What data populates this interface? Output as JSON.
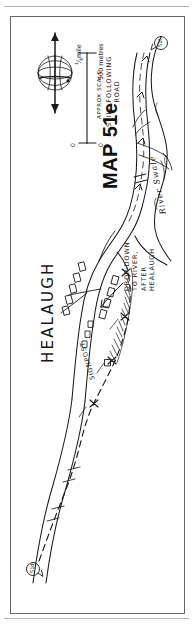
{
  "document": {
    "type": "hand-drawn walking route map",
    "map_title": "MAP 51e",
    "orientation": "map printed sideways (rotated 90 degrees) on the page"
  },
  "map": {
    "title": "MAP 51e",
    "place_label": "HEALAUGH",
    "river_label": "River Swale",
    "annotations": [
      {
        "id": "signpost",
        "text": "SIGNPOST"
      },
      {
        "id": "drop-down",
        "line1": "DROP DOWN",
        "line2": "TO RIVER,",
        "line3": "AFTER",
        "line4": "HEALAUGH"
      },
      {
        "id": "still-road",
        "line1": "STILL FOLLOWING",
        "line2": "ROAD"
      }
    ],
    "markers": [
      {
        "id": "marker-north",
        "label": "51d"
      },
      {
        "id": "marker-south",
        "label": "51f"
      }
    ],
    "compass": {
      "icon": "globe-icon",
      "left_arrow": "west-arrow",
      "right_arrow": "east-arrow"
    },
    "scale_bar": {
      "caption": "APPROX SCALE",
      "imperial": {
        "zero": "0",
        "max_value": "1/4",
        "max_unit": "mile",
        "max_numerator": "1",
        "max_denominator": "4"
      },
      "metric": {
        "zero": "0",
        "max": "500 metres"
      }
    },
    "colors": {
      "ink": "#1b1b1b",
      "paper": "#ffffff",
      "frame": "#666666",
      "rule": "#b9b9b9"
    }
  }
}
